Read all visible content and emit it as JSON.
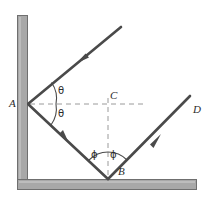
{
  "figure": {
    "type": "optics-reflection-diagram",
    "width": 213,
    "height": 202,
    "background_color": "#ffffff",
    "colors": {
      "wall_fill": "#a8a8a8",
      "wall_stroke": "#6f6f6f",
      "ray_stroke": "#4a4a4a",
      "dashed_stroke": "#9a9a9a",
      "arc_stroke": "#4a4a4a",
      "label_color": "#2b2b2b"
    },
    "labels": [
      {
        "id": "A",
        "text": "A",
        "x": 9,
        "y": 98,
        "kind": "point",
        "italic": true
      },
      {
        "id": "C",
        "text": "C",
        "x": 110,
        "y": 90,
        "kind": "point",
        "italic": true
      },
      {
        "id": "D",
        "text": "D",
        "x": 193,
        "y": 104,
        "kind": "point",
        "italic": true
      },
      {
        "id": "B",
        "text": "B",
        "x": 118,
        "y": 166,
        "kind": "point",
        "italic": true
      },
      {
        "id": "theta-upper",
        "text": "θ",
        "x": 58,
        "y": 86,
        "kind": "angle",
        "italic": false
      },
      {
        "id": "theta-lower",
        "text": "θ",
        "x": 58,
        "y": 109,
        "kind": "angle",
        "italic": false
      },
      {
        "id": "phi-left",
        "text": "ϕ",
        "x": 91,
        "y": 150,
        "kind": "angle",
        "italic": false
      },
      {
        "id": "phi-right",
        "text": "ϕ",
        "x": 110,
        "y": 150,
        "kind": "angle",
        "italic": false
      }
    ],
    "walls": [
      {
        "id": "vertical-mirror",
        "orientation": "vertical",
        "x": 17,
        "y": 15,
        "width": 11,
        "height": 166
      },
      {
        "id": "horizontal-mirror",
        "orientation": "horizontal",
        "x": 17,
        "y": 179,
        "width": 180,
        "height": 11
      }
    ],
    "points": {
      "A": {
        "x": 28,
        "y": 104
      },
      "B": {
        "x": 108,
        "y": 179
      },
      "C": {
        "x": 108,
        "y": 104
      },
      "D": {
        "x": 190,
        "y": 96
      },
      "incoming_start": {
        "x": 121,
        "y": 27
      }
    },
    "rays": [
      {
        "id": "incoming-ray",
        "from": "incoming_start",
        "to": "A",
        "arrow_at": {
          "x": 82,
          "y": 59
        },
        "direction": "down-left"
      },
      {
        "id": "ray-a-to-b",
        "from": "A",
        "to": "B",
        "arrow_at": {
          "x": 64,
          "y": 138
        },
        "direction": "down-right"
      },
      {
        "id": "ray-b-to-d",
        "from": "B",
        "to": "D",
        "arrow_at": {
          "x": 155,
          "y": 139
        },
        "direction": "up-right"
      }
    ],
    "dashed_lines": [
      {
        "id": "normal-horizontal-at-A",
        "x1": 30,
        "y1": 104,
        "x2": 145,
        "y2": 104
      },
      {
        "id": "normal-vertical-at-B",
        "x1": 108,
        "y1": 98,
        "x2": 108,
        "y2": 176
      }
    ],
    "arcs": [
      {
        "id": "arc-theta-upper",
        "center": "A",
        "radius": 28,
        "between": "incoming-ray and normal-horizontal"
      },
      {
        "id": "arc-theta-lower",
        "center": "A",
        "radius": 28,
        "between": "normal-horizontal and ray-a-to-b"
      },
      {
        "id": "arc-phi-left",
        "center": "B",
        "radius": 27,
        "between": "ray-a-to-b and normal-vertical"
      },
      {
        "id": "arc-phi-right",
        "center": "B",
        "radius": 27,
        "between": "normal-vertical and ray-b-to-d"
      }
    ]
  }
}
